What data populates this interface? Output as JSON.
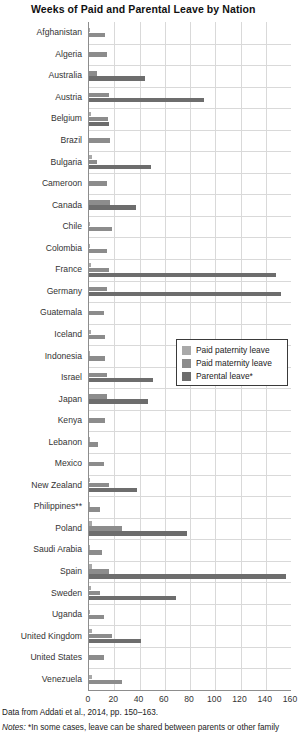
{
  "chart_data": {
    "type": "bar",
    "orientation": "horizontal",
    "title": "Weeks of Paid and Parental Leave by Nation",
    "xlabel": "",
    "ylabel": "",
    "xlim": [
      0,
      160
    ],
    "xticks": [
      0,
      20,
      40,
      60,
      80,
      100,
      120,
      140,
      160
    ],
    "grid": true,
    "legend_position": "center-right-inside",
    "colors": {
      "paid_paternity": "#a9a9a9",
      "paid_maternity": "#8c8c8c",
      "parental": "#6d6d6d"
    },
    "series": [
      {
        "name": "Paid paternity leave",
        "key": "paternity",
        "color": "#a9a9a9"
      },
      {
        "name": "Paid maternity leave",
        "key": "maternity",
        "color": "#8c8c8c"
      },
      {
        "name": "Parental leave*",
        "key": "parental",
        "color": "#6d6d6d"
      }
    ],
    "categories": [
      "Afghanistan",
      "Algeria",
      "Australia",
      "Austria",
      "Belgium",
      "Brazil",
      "Bulgaria",
      "Cameroon",
      "Canada",
      "Chile",
      "Colombia",
      "France",
      "Germany",
      "Guatemala",
      "Iceland",
      "Indonesia",
      "Israel",
      "Japan",
      "Kenya",
      "Lebanon",
      "Mexico",
      "New Zealand",
      "Philippines**",
      "Poland",
      "Saudi Arabia",
      "Spain",
      "Sweden",
      "Uganda",
      "United Kingdom",
      "United States",
      "Venezuela"
    ],
    "values": {
      "paternity": [
        0.4,
        0,
        0,
        0,
        1.4,
        0,
        2,
        0,
        0,
        0.7,
        1.1,
        1.6,
        0,
        0,
        1.3,
        0.3,
        0,
        0,
        0,
        0.4,
        0,
        0.4,
        1,
        2,
        0.4,
        2.1,
        1.4,
        0.6,
        2,
        0,
        2
      ],
      "maternity": [
        13,
        14,
        6,
        16,
        15,
        17,
        6,
        14,
        17,
        18,
        14,
        16,
        14,
        12,
        13,
        13,
        14,
        14,
        13,
        7,
        12,
        16,
        9,
        26,
        10,
        16,
        9,
        12,
        18,
        12,
        26
      ],
      "parental": [
        0,
        0,
        44,
        91,
        16,
        0,
        49,
        0,
        37,
        0,
        0,
        148,
        152,
        0,
        0,
        0,
        51,
        47,
        0,
        0,
        0,
        38,
        0,
        78,
        0,
        156,
        69,
        0,
        41,
        0,
        0
      ]
    },
    "source_note": "Data from Addati et al., 2014, pp. 150–163.",
    "notes_label": "Notes:",
    "notes_text": " *In some cases, leave can be shared between parents or other family"
  },
  "legend": {
    "items": [
      {
        "label": "Paid paternity leave",
        "color": "#a9a9a9"
      },
      {
        "label": "Paid maternity leave",
        "color": "#8c8c8c"
      },
      {
        "label": "Parental leave*",
        "color": "#6d6d6d"
      }
    ]
  }
}
